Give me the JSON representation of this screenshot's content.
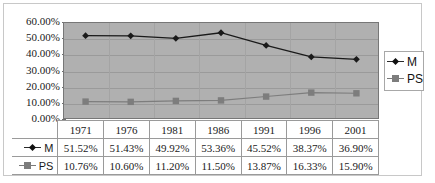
{
  "chart_data": {
    "type": "line",
    "title": "",
    "xlabel": "",
    "ylabel": "",
    "categories": [
      "1971",
      "1976",
      "1981",
      "1986",
      "1991",
      "1996",
      "2001"
    ],
    "ylim": [
      0,
      60
    ],
    "ytick_labels": [
      "60.00%",
      "50.00%",
      "40.00%",
      "30.00%",
      "20.00%",
      "10.00%",
      "0.00%"
    ],
    "ytick_values": [
      60,
      50,
      40,
      30,
      20,
      10,
      0
    ],
    "grid": true,
    "legend_position": "right",
    "series": [
      {
        "name": "M",
        "marker": "diamond",
        "color": "#1a1a1a",
        "values": [
          51.52,
          51.43,
          49.92,
          53.36,
          45.52,
          38.37,
          36.9
        ],
        "labels": [
          "51.52%",
          "51.43%",
          "49.92%",
          "53.36%",
          "45.52%",
          "38.37%",
          "36.90%"
        ]
      },
      {
        "name": "PS",
        "marker": "square",
        "color": "#7d7d7d",
        "values": [
          10.76,
          10.6,
          11.2,
          11.5,
          13.87,
          16.33,
          15.9
        ],
        "labels": [
          "10.76%",
          "10.60%",
          "11.20%",
          "11.50%",
          "13.87%",
          "16.33%",
          "15.90%"
        ]
      }
    ]
  },
  "legend": {
    "items": [
      {
        "label": "M"
      },
      {
        "label": "PS"
      }
    ]
  },
  "table": {
    "header": [
      "1971",
      "1976",
      "1981",
      "1986",
      "1991",
      "1996",
      "2001"
    ],
    "rows": [
      {
        "label": "M",
        "values": [
          "51.52%",
          "51.43%",
          "49.92%",
          "53.36%",
          "45.52%",
          "38.37%",
          "36.90%"
        ]
      },
      {
        "label": "PS",
        "values": [
          "10.76%",
          "10.60%",
          "11.20%",
          "11.50%",
          "13.87%",
          "16.33%",
          "15.90%"
        ]
      }
    ]
  },
  "colors": {
    "plot_background": "#b0b0b0",
    "series_m": "#1a1a1a",
    "series_ps": "#7d7d7d",
    "gridline": "#9a9a9a",
    "frame_border": "#c8c8c8"
  }
}
